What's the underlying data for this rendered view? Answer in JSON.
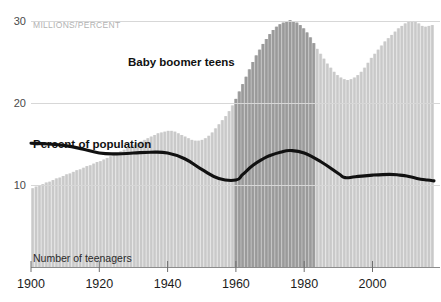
{
  "chart_data": {
    "type": "bar",
    "title": "",
    "subtitle": "",
    "unit_label": "MILLIONS/PERCENT",
    "xlabel": "",
    "ylabel": "",
    "ylim": [
      0,
      32
    ],
    "xlim": [
      1900,
      2018
    ],
    "grid": true,
    "gridlines": [
      10,
      20,
      30
    ],
    "legend_position": "inline-annotations",
    "y_ticks": [
      "10",
      "20",
      "30"
    ],
    "y_tick_values": [
      10,
      20,
      30
    ],
    "x_ticks": [
      "1900",
      "1920",
      "1940",
      "1960",
      "1980",
      "2000"
    ],
    "x_tick_values": [
      1900,
      1920,
      1940,
      1960,
      2000,
      1980
    ],
    "annotations": [
      {
        "text": "Baby boomer teens",
        "x": 1950,
        "y": 25.5,
        "style": "bold"
      },
      {
        "text": "Percent of population",
        "x": 1906,
        "y": 16.2,
        "style": "bold"
      },
      {
        "text": "Number of teenagers",
        "x": 1906,
        "y": 3.6,
        "style": "plain"
      }
    ],
    "highlight_region": {
      "label": "Baby boomer teens",
      "start": 1960,
      "end": 1984,
      "color": "#999999"
    },
    "colors": {
      "bar": "#c9c9c9",
      "bar_highlight": "#9a9a9a",
      "line": "#111111",
      "grid": "#d7d7d7",
      "axis": "#555555",
      "unit_text": "#b2b2b2"
    },
    "series": [
      {
        "name": "Number of teenagers",
        "type": "bar",
        "unit": "millions",
        "x": [
          1900,
          1901,
          1902,
          1903,
          1904,
          1905,
          1906,
          1907,
          1908,
          1909,
          1910,
          1911,
          1912,
          1913,
          1914,
          1915,
          1916,
          1917,
          1918,
          1919,
          1920,
          1921,
          1922,
          1923,
          1924,
          1925,
          1926,
          1927,
          1928,
          1929,
          1930,
          1931,
          1932,
          1933,
          1934,
          1935,
          1936,
          1937,
          1938,
          1939,
          1940,
          1941,
          1942,
          1943,
          1944,
          1945,
          1946,
          1947,
          1948,
          1949,
          1950,
          1951,
          1952,
          1953,
          1954,
          1955,
          1956,
          1957,
          1958,
          1959,
          1960,
          1961,
          1962,
          1963,
          1964,
          1965,
          1966,
          1967,
          1968,
          1969,
          1970,
          1971,
          1972,
          1973,
          1974,
          1975,
          1976,
          1977,
          1978,
          1979,
          1980,
          1981,
          1982,
          1983,
          1984,
          1985,
          1986,
          1987,
          1988,
          1989,
          1990,
          1991,
          1992,
          1993,
          1994,
          1995,
          1996,
          1997,
          1998,
          1999,
          2000,
          2001,
          2002,
          2003,
          2004,
          2005,
          2006,
          2007,
          2008,
          2009,
          2010,
          2011,
          2012,
          2013,
          2014,
          2015,
          2016,
          2017,
          2018
        ],
        "values": [
          9.6,
          9.8,
          9.9,
          10.1,
          10.3,
          10.4,
          10.6,
          10.8,
          10.9,
          11.1,
          11.3,
          11.4,
          11.6,
          11.8,
          11.9,
          12.1,
          12.3,
          12.4,
          12.6,
          12.8,
          12.9,
          13.1,
          13.3,
          13.5,
          13.7,
          13.9,
          14.1,
          14.3,
          14.5,
          14.7,
          14.9,
          15.1,
          15.3,
          15.5,
          15.7,
          15.9,
          16.1,
          16.3,
          16.4,
          16.5,
          16.6,
          16.6,
          16.5,
          16.3,
          16.1,
          15.9,
          15.7,
          15.5,
          15.4,
          15.4,
          15.5,
          15.7,
          16.0,
          16.4,
          16.9,
          17.4,
          17.9,
          18.4,
          19.0,
          19.7,
          20.5,
          21.4,
          22.3,
          23.2,
          24.1,
          25.0,
          25.8,
          26.5,
          27.2,
          27.8,
          28.4,
          28.9,
          29.3,
          29.6,
          29.8,
          30.0,
          30.1,
          30.0,
          29.8,
          29.5,
          29.1,
          28.6,
          28.0,
          27.3,
          26.6,
          26.0,
          25.4,
          24.8,
          24.3,
          23.8,
          23.4,
          23.1,
          22.9,
          22.8,
          22.9,
          23.1,
          23.4,
          23.8,
          24.3,
          24.9,
          25.5,
          26.0,
          26.5,
          27.0,
          27.5,
          27.9,
          28.3,
          28.7,
          29.1,
          29.4,
          29.7,
          29.9,
          30.0,
          29.9,
          29.7,
          29.4,
          29.3,
          29.4,
          29.5
        ],
        "highlight_start_index": 60,
        "highlight_end_index": 83
      },
      {
        "name": "Percent of population",
        "type": "line",
        "unit": "percent",
        "x": [
          1900,
          1905,
          1910,
          1915,
          1920,
          1925,
          1930,
          1935,
          1940,
          1945,
          1950,
          1955,
          1960,
          1962,
          1965,
          1968,
          1970,
          1973,
          1976,
          1980,
          1985,
          1990,
          1992,
          1995,
          2000,
          2005,
          2008,
          2010,
          2013,
          2016,
          2018
        ],
        "values": [
          15.1,
          15.0,
          14.8,
          14.4,
          13.9,
          13.8,
          13.9,
          14.0,
          13.9,
          13.2,
          11.9,
          10.8,
          10.6,
          11.3,
          12.4,
          13.2,
          13.6,
          14.0,
          14.2,
          13.9,
          12.8,
          11.4,
          10.9,
          11.0,
          11.2,
          11.3,
          11.2,
          11.1,
          10.8,
          10.6,
          10.5
        ]
      }
    ]
  }
}
